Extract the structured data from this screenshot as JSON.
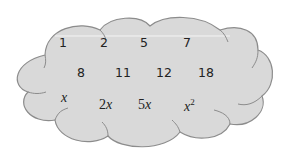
{
  "diagram": {
    "shape": "cloud",
    "fill_color": "#d9d9d9",
    "stroke_color": "#8c8c8c",
    "rows": [
      [
        "1",
        "2",
        "5",
        "7"
      ],
      [
        "8",
        "11",
        "12",
        "18"
      ],
      [
        "x",
        "2x",
        "5x",
        "x²"
      ]
    ],
    "terms": {
      "r0c0": "1",
      "r0c1": "2",
      "r0c2": "5",
      "r0c3": "7",
      "r1c0": "8",
      "r1c1": "11",
      "r1c2": "12",
      "r1c3": "18",
      "r2c0": "x",
      "r2c1_coef": "2",
      "r2c1_var": "x",
      "r2c2_coef": "5",
      "r2c2_var": "x",
      "r2c3_base": "x",
      "r2c3_exp": "2"
    }
  }
}
